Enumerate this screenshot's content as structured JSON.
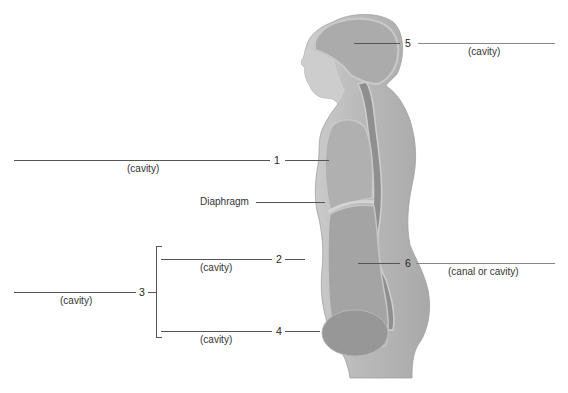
{
  "figure": {
    "labels": [
      {
        "id": "1",
        "number": "1",
        "answer_hint": "(cavity)"
      },
      {
        "id": "2",
        "number": "2",
        "answer_hint": "(cavity)"
      },
      {
        "id": "3",
        "number": "3",
        "answer_hint": "(cavity)"
      },
      {
        "id": "4",
        "number": "4",
        "answer_hint": "(cavity)"
      },
      {
        "id": "5",
        "number": "5",
        "answer_hint": "(cavity)"
      },
      {
        "id": "6",
        "number": "6",
        "answer_hint": "(canal or cavity)"
      }
    ],
    "named_structures": {
      "diaphragm": "Diaphragm"
    },
    "colors": {
      "body": "#bdbdbd",
      "body_dark": "#9a9a9a",
      "cavity": "#a8a8a8",
      "spine": "#8a8a8a",
      "line": "#555555"
    }
  }
}
